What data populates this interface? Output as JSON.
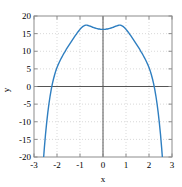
{
  "chart_data": {
    "type": "line",
    "title": "",
    "xlabel": "x",
    "ylabel": "y",
    "xlim": [
      -3,
      3
    ],
    "ylim": [
      -20,
      20
    ],
    "xticks": [
      -3,
      -2,
      -1,
      0,
      1,
      2,
      3
    ],
    "yticks": [
      -20,
      -15,
      -10,
      -5,
      0,
      5,
      10,
      15,
      20
    ],
    "xtick_labels": [
      "-3",
      "-2",
      "-1",
      "0",
      "1",
      "2",
      "3"
    ],
    "ytick_labels": [
      "-20",
      "-15",
      "-10",
      "-5",
      "0",
      "5",
      "10",
      "15",
      "20"
    ],
    "grid": true,
    "grid_style": "dotted",
    "legend": null,
    "series": [
      {
        "name": "curve",
        "color": "#2f7fc1",
        "line_width": 1.4,
        "x": [
          -2.7,
          -2.65,
          -2.6,
          -2.55,
          -2.5,
          -2.45,
          -2.4,
          -2.35,
          -2.3,
          -2.25,
          -2.2,
          -2.15,
          -2.1,
          -2.05,
          -2.0,
          -1.95,
          -1.9,
          -1.85,
          -1.8,
          -1.75,
          -1.7,
          -1.65,
          -1.6,
          -1.55,
          -1.5,
          -1.45,
          -1.4,
          -1.35,
          -1.3,
          -1.25,
          -1.2,
          -1.15,
          -1.1,
          -1.05,
          -1.0,
          -0.95,
          -0.9,
          -0.85,
          -0.8,
          -0.75,
          -0.7,
          -0.65,
          -0.6,
          -0.55,
          -0.5,
          -0.45,
          -0.4,
          -0.35,
          -0.3,
          -0.25,
          -0.2,
          -0.15,
          -0.1,
          -0.05,
          0.0,
          0.05,
          0.1,
          0.15,
          0.2,
          0.25,
          0.3,
          0.35,
          0.4,
          0.45,
          0.5,
          0.55,
          0.6,
          0.65,
          0.7,
          0.75,
          0.8,
          0.85,
          0.9,
          0.95,
          1.0,
          1.05,
          1.1,
          1.15,
          1.2,
          1.25,
          1.3,
          1.35,
          1.4,
          1.45,
          1.5,
          1.55,
          1.6,
          1.65,
          1.7,
          1.75,
          1.8,
          1.85,
          1.9,
          1.95,
          2.0,
          2.05,
          2.1,
          2.15,
          2.2,
          2.25,
          2.3,
          2.35,
          2.4,
          2.45,
          2.5,
          2.55,
          2.6,
          2.65,
          2.7
        ],
        "y": [
          -32.1,
          -26.6,
          -21.7,
          -17.4,
          -13.6,
          -10.3,
          -7.4,
          -4.9,
          -2.7,
          -0.8,
          0.8,
          2.2,
          3.4,
          4.5,
          5.4,
          6.2,
          6.9,
          7.6,
          8.2,
          8.8,
          9.4,
          9.9,
          10.5,
          11.0,
          11.5,
          12.0,
          12.5,
          13.0,
          13.5,
          14.0,
          14.5,
          14.9,
          15.4,
          15.8,
          16.2,
          16.6,
          16.9,
          17.1,
          17.3,
          17.4,
          17.4,
          17.3,
          17.2,
          17.1,
          17.0,
          16.8,
          16.7,
          16.6,
          16.5,
          16.4,
          16.3,
          16.3,
          16.2,
          16.2,
          16.2,
          16.2,
          16.2,
          16.3,
          16.3,
          16.4,
          16.5,
          16.6,
          16.7,
          16.8,
          17.0,
          17.1,
          17.2,
          17.3,
          17.4,
          17.4,
          17.3,
          17.1,
          16.9,
          16.6,
          16.2,
          15.8,
          15.4,
          14.9,
          14.5,
          14.0,
          13.5,
          13.0,
          12.5,
          12.0,
          11.5,
          11.0,
          10.5,
          9.9,
          9.4,
          8.8,
          8.2,
          7.6,
          6.9,
          6.2,
          5.4,
          4.5,
          3.4,
          2.2,
          0.8,
          -0.8,
          -2.7,
          -4.9,
          -7.4,
          -10.3,
          -13.6,
          -17.4,
          -21.7,
          -26.6,
          -32.1
        ]
      }
    ],
    "annotations": {
      "local_maxima": [
        {
          "x": -1.0,
          "y": 17.4
        },
        {
          "x": 1.0,
          "y": 17.4
        }
      ],
      "local_minimum": {
        "x": 0.0,
        "y": 16.2
      },
      "zero_crossings": [
        -2.22,
        2.22
      ]
    }
  },
  "axes": {
    "x_axis_title": "x",
    "y_axis_title": "y"
  },
  "colors": {
    "curve": "#2f7fc1",
    "grid": "#cfcfcf",
    "axis_line": "#555555",
    "frame": "#8c8c8c",
    "background": "#ffffff",
    "text": "#000000"
  }
}
